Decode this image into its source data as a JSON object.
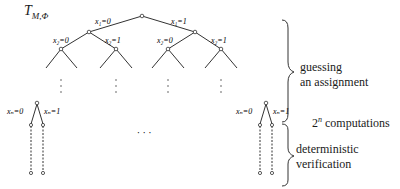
{
  "diagram": {
    "title": "T",
    "title_subscript": "M,Φ",
    "root_edges": {
      "left": "x₁=0",
      "right": "x₁=1"
    },
    "level2_edges": [
      "x₂=0",
      "x₂=1",
      "x₂=0",
      "x₂=1"
    ],
    "leaf_edges": {
      "left": "xₙ=0",
      "right": "xₙ=1"
    },
    "middle_ellipsis": "· · ·",
    "annotations": {
      "guessing_line1": "guessing",
      "guessing_line2": "an assignment",
      "computations_base": "2",
      "computations_exp": "n",
      "computations_label": " computations",
      "verification_line1": "deterministic",
      "verification_line2": "verification"
    }
  }
}
